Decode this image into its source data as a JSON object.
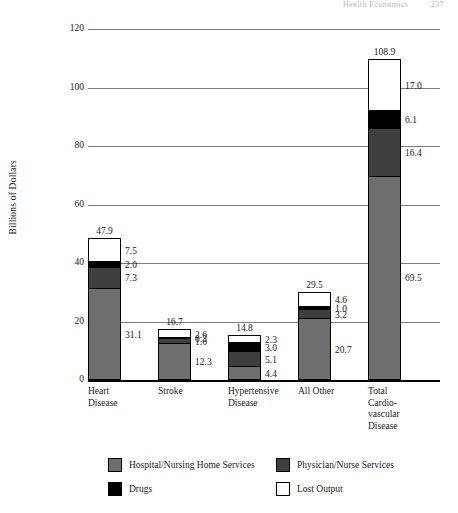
{
  "page_header": {
    "running_head": "Health Economics",
    "page_number": "237"
  },
  "chart_data": {
    "type": "bar",
    "subtype": "stacked-bar",
    "title": "",
    "xlabel": "",
    "ylabel": "Billions of Dollars",
    "ylim": [
      0,
      120
    ],
    "yticks": [
      "0",
      "20",
      "40",
      "60",
      "80",
      "100",
      "120"
    ],
    "grid": true,
    "legend_position": "bottom",
    "categories": [
      "Heart Disease",
      "Stroke",
      "Hypertensive Disease",
      "All Other",
      "Total Cardiovascular Disease"
    ],
    "category_display": [
      [
        "Heart",
        "Disease"
      ],
      [
        "Stroke"
      ],
      [
        "Hypertensive",
        "Disease"
      ],
      [
        "All Other"
      ],
      [
        "Total",
        "Cardio-",
        "vascular",
        "Disease"
      ]
    ],
    "series": [
      {
        "name": "Hospital/Nursing Home Services",
        "color": "#6e6e6e",
        "values": [
          31.1,
          12.3,
          4.4,
          20.7,
          69.5
        ]
      },
      {
        "name": "Physician/Nurse Services",
        "color": "#3f3f3f",
        "values": [
          7.3,
          1.6,
          5.1,
          3.2,
          16.4
        ]
      },
      {
        "name": "Drugs",
        "color": "#000000",
        "values": [
          2.0,
          0.3,
          3.0,
          1.0,
          6.1
        ]
      },
      {
        "name": "Lost Output",
        "color": "#ffffff",
        "values": [
          7.5,
          2.6,
          2.3,
          4.6,
          17.0
        ]
      }
    ],
    "totals": [
      47.9,
      16.7,
      14.8,
      29.5,
      108.9
    ],
    "value_labels": {
      "Heart Disease": [
        "31.1",
        "7.3",
        "2.0",
        "7.5"
      ],
      "Stroke": [
        "12.3",
        "1.6",
        "0.3",
        "2.6"
      ],
      "Hypertensive Disease": [
        "4.4",
        "5.1",
        "3.0",
        "2.3"
      ],
      "All Other": [
        "20.7",
        "3.2",
        "1.0",
        "4.6"
      ],
      "Total Cardiovascular Disease": [
        "69.5",
        "16.4",
        "6.1",
        "17.0"
      ]
    },
    "total_labels": [
      "47.9",
      "16.7",
      "14.8",
      "29.5",
      "108.9"
    ]
  },
  "legend": {
    "items": [
      {
        "label": "Hospital/Nursing Home Services",
        "color": "#6e6e6e"
      },
      {
        "label": "Physician/Nurse Services",
        "color": "#3f3f3f"
      },
      {
        "label": "Drugs",
        "color": "#000000"
      },
      {
        "label": "Lost Output",
        "color": "#ffffff"
      }
    ]
  }
}
